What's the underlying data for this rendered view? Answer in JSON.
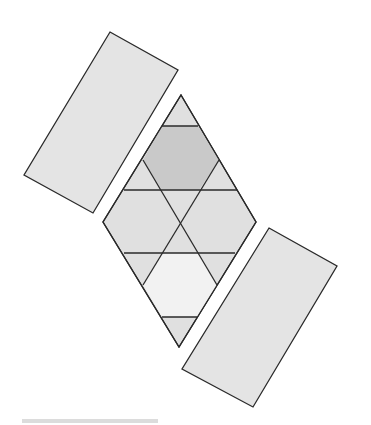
{
  "figure": {
    "colors": {
      "stroke": "#2a2a2a",
      "rectangle_fill": "#e4e4e4",
      "region_fill": "#e0e0e0",
      "top_hexagon_fill": "#c9c9c9",
      "bottom_hexagon_fill": "#f2f2f2",
      "caption_bar": "#dcdcdc"
    },
    "shapes": {
      "rect_top_left": "110,32 178,70 93,213 24,175",
      "rect_bottom_right": "269,228 337,266 253,407 182,369",
      "rhombus": "181,95 256,222 179,347 103,222",
      "top_hexagon": "162,126 198,126 219,160 199,190 162,190 143,160",
      "bottom_hexagon": "162,253 199,253 217,285 197,317 162,317 143,285",
      "lines": [
        "162,126 198,126",
        "124,190 237,190",
        "124,253 235,253",
        "162,317 197,317",
        "143,160 217,285",
        "219,160 143,285"
      ]
    },
    "caption": ""
  }
}
